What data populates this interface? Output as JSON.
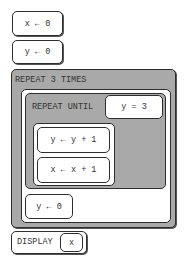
{
  "blocks": {
    "assign_x0": "x ← 0",
    "assign_y0": "y ← 0",
    "repeat_times": {
      "keyword": "REPEAT 3 TIMES",
      "repeat_until": {
        "keyword": "REPEAT UNTIL",
        "condition": "y = 3",
        "body": [
          "y ← y + 1",
          "x ← x + 1"
        ]
      },
      "after": "y ← 0"
    },
    "display": {
      "keyword": "DISPLAY",
      "arg": "x"
    }
  },
  "colors": {
    "gray_fill": "#a9a9a9",
    "outline": "#2e2e2e",
    "text": "#333333"
  }
}
